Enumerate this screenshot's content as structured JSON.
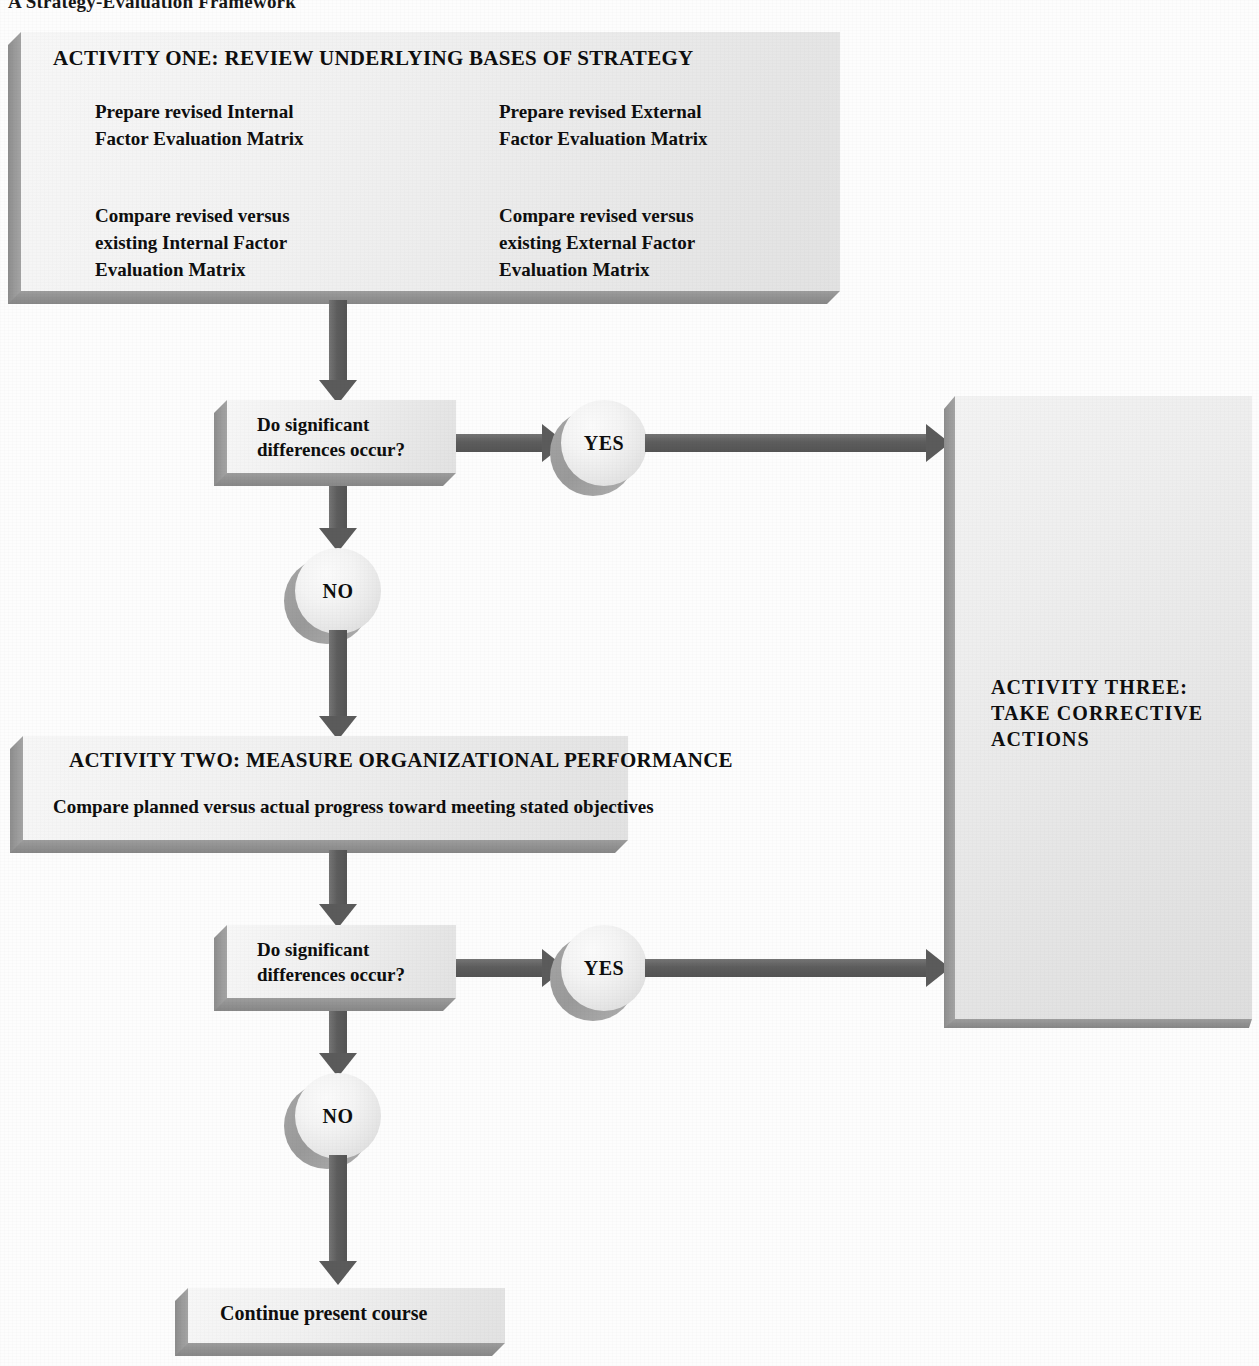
{
  "figure": {
    "title": "A Strategy-Evaluation Framework",
    "type": "flowchart"
  },
  "activity_one": {
    "heading": "ACTIVITY ONE: REVIEW UNDERLYING BASES OF STRATEGY",
    "col1_item1": "Prepare revised Internal\nFactor Evaluation Matrix",
    "col2_item1": "Prepare revised External\nFactor Evaluation Matrix",
    "col1_item2": "Compare revised versus\nexisting Internal Factor\nEvaluation Matrix",
    "col2_item2": "Compare revised versus\nexisting External Factor\nEvaluation Matrix"
  },
  "decision_one": {
    "question": "Do significant\ndifferences occur?",
    "yes_label": "YES",
    "no_label": "NO"
  },
  "activity_two": {
    "heading": "ACTIVITY TWO: MEASURE ORGANIZATIONAL PERFORMANCE",
    "body": "Compare planned versus actual progress toward meeting stated objectives"
  },
  "decision_two": {
    "question": "Do significant\ndifferences occur?",
    "yes_label": "YES",
    "no_label": "NO"
  },
  "activity_three": {
    "heading": "ACTIVITY THREE:\nTAKE CORRECTIVE\nACTIONS"
  },
  "terminal": {
    "label": "Continue present course"
  },
  "colors": {
    "box_face_light": "#f7f7f7",
    "box_face_dark": "#e2e2e2",
    "box_shadow": "#9a9a9a",
    "arrow": "#5b5b5b",
    "text": "#0e0e0e",
    "page_background": "#fdfdfd"
  }
}
